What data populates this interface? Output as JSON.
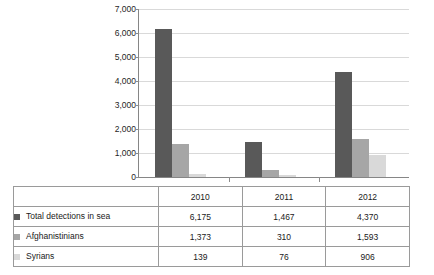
{
  "chart_data": {
    "type": "bar",
    "title": "",
    "subtitle": "",
    "xlabel": "",
    "ylabel": "",
    "categories": [
      "2010",
      "2011",
      "2012"
    ],
    "series": [
      {
        "name": "Total detections in sea",
        "values": [
          6175,
          1467,
          4370
        ],
        "color": "#595959"
      },
      {
        "name": "Afghanistinians",
        "values": [
          1373,
          310,
          1593
        ],
        "color": "#a6a6a6"
      },
      {
        "name": "Syrians",
        "values": [
          139,
          76,
          906
        ],
        "color": "#d9d9d9"
      }
    ],
    "ylim": [
      0,
      7000
    ],
    "y_ticks": [
      "0",
      "1,000",
      "2,000",
      "3,000",
      "4,000",
      "5,000",
      "6,000",
      "7,000"
    ],
    "y_tick_values": [
      0,
      1000,
      2000,
      3000,
      4000,
      5000,
      6000,
      7000
    ],
    "grid": true,
    "legend_position": "data-table-below"
  },
  "table": {
    "corner_label": "",
    "column_headers": [
      "2010",
      "2011",
      "2012"
    ],
    "rows": [
      {
        "label": "Total detections in sea",
        "swatch_color": "#595959",
        "values": [
          "6,175",
          "1,467",
          "4,370"
        ]
      },
      {
        "label": "Afghanistinians",
        "swatch_color": "#a6a6a6",
        "values": [
          "1,373",
          "310",
          "1,593"
        ]
      },
      {
        "label": "Syrians",
        "swatch_color": "#d9d9d9",
        "values": [
          "139",
          "76",
          "906"
        ]
      }
    ]
  },
  "colors": {
    "series_1": "#595959",
    "series_2": "#a6a6a6",
    "series_3": "#d9d9d9",
    "gridline": "#d9d9d9",
    "axis": "#868686",
    "table_border": "#9a9a9a",
    "text": "#1a1a1a",
    "background": "#ffffff"
  }
}
